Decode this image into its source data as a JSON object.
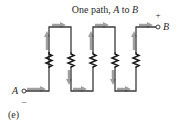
{
  "title": "One path, A to B",
  "title_prefix": "One path, ",
  "title_a": "A",
  "title_mid": " to ",
  "title_b": "B",
  "terminals": {
    "a": {
      "label": "A",
      "polarity": "–"
    },
    "b": {
      "label": "B",
      "polarity": "+"
    }
  },
  "caption": "(e)",
  "colors": {
    "wire": "#3a3a3a",
    "arrow": "#9a9a9a",
    "resistor": "#1a1a1a",
    "text": "#2a2a2a"
  },
  "circuit": {
    "type": "series",
    "resistor_count": 5,
    "path": "Single series path from terminal A through five resistors to terminal B"
  }
}
